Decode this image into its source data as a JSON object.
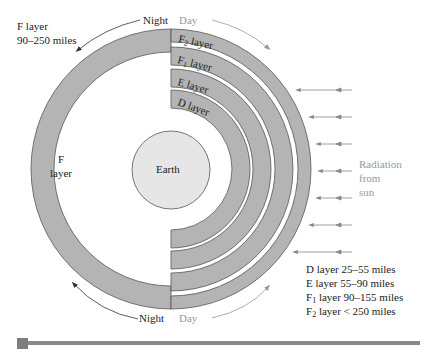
{
  "diagram": {
    "title_label": {
      "line1": "F layer",
      "line2": "90–250 miles"
    },
    "top_labels": {
      "night": "Night",
      "day": "Day"
    },
    "bottom_labels": {
      "night": "Night",
      "day": "Day"
    },
    "layers": {
      "F": {
        "line1": "F",
        "line2": "layer"
      },
      "F2": {
        "name": "F",
        "sub": "2",
        "suffix": " layer"
      },
      "F1": {
        "name": "F",
        "sub": "1",
        "suffix": " layer"
      },
      "E": {
        "name": "E layer"
      },
      "D": {
        "name": "D layer"
      }
    },
    "earth_label": "Earth",
    "radiation_label": {
      "line1": "Radiation",
      "line2": "from",
      "line3": "sun"
    },
    "legend": [
      {
        "prefix": "D layer",
        "sub": "",
        "text": "D layer 25–55 miles"
      },
      {
        "prefix": "E layer",
        "sub": "",
        "text": "E layer 55–90 miles"
      },
      {
        "prefix": "F",
        "sub": "1",
        "suffix": " layer 90–155 miles"
      },
      {
        "prefix": "F",
        "sub": "2",
        "suffix": " layer < 250 miles"
      }
    ],
    "colors": {
      "layer_fill": "#b4b4b4",
      "earth_fill": "#e6e6e6",
      "stroke": "#555555",
      "day_text": "#9a9a9a",
      "arrow": "#8a8a8a"
    }
  }
}
